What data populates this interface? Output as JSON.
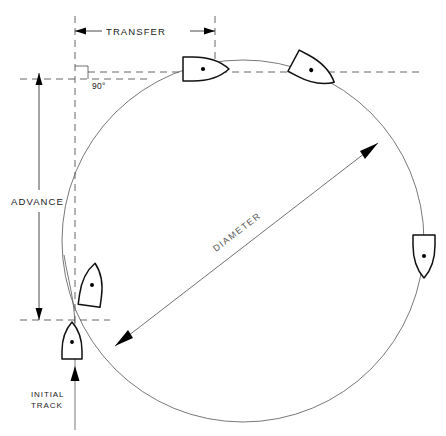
{
  "diagram": {
    "labels": {
      "transfer": "TRANSFER",
      "advance": "ADVANCE",
      "diameter": "DIAMETER",
      "angle": "90°",
      "initial_track_line1": "INITIAL",
      "initial_track_line2": "TRACK"
    },
    "colors": {
      "ink": "#222222",
      "line": "#555555",
      "ship_outline": "#111111",
      "background": "#ffffff"
    },
    "geometry": {
      "circle_center_x": 243,
      "circle_center_y": 241,
      "circle_radius": 181,
      "initial_track_x": 75,
      "transfer_start_x": 75,
      "transfer_end_x": 215,
      "transfer_y": 31,
      "advance_x": 39,
      "advance_top_y": 73,
      "advance_bottom_y": 320,
      "ninety_degree_x": 75,
      "ninety_degree_y": 79
    },
    "ships": [
      {
        "name": "ship-initial",
        "x": 72,
        "y": 341,
        "rotation": 0
      },
      {
        "name": "ship-turn-start",
        "x": 90,
        "y": 285,
        "rotation": 8
      },
      {
        "name": "ship-ninety-degrees",
        "x": 205,
        "y": 68,
        "rotation": 90
      },
      {
        "name": "ship-past-ninety",
        "x": 313,
        "y": 70,
        "rotation": 118
      },
      {
        "name": "ship-starboard",
        "x": 425,
        "y": 256,
        "rotation": 180
      }
    ]
  }
}
